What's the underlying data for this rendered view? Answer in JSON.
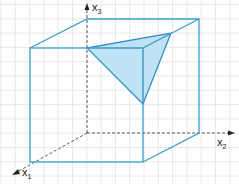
{
  "diagram": {
    "type": "3d-cube-with-triangle-section",
    "axes": [
      {
        "name": "x1",
        "base": "x",
        "sub": "1"
      },
      {
        "name": "x2",
        "base": "x",
        "sub": "2"
      },
      {
        "name": "x3",
        "base": "x",
        "sub": "3"
      }
    ],
    "colors": {
      "cube_edge": "#3a9fd0",
      "triangle_fill": "#bfe3f4",
      "triangle_edge": "#3a8fc8",
      "hidden_edge": "#9a9a9a",
      "axis": "#333333",
      "grid": "#e2e2e2"
    }
  }
}
